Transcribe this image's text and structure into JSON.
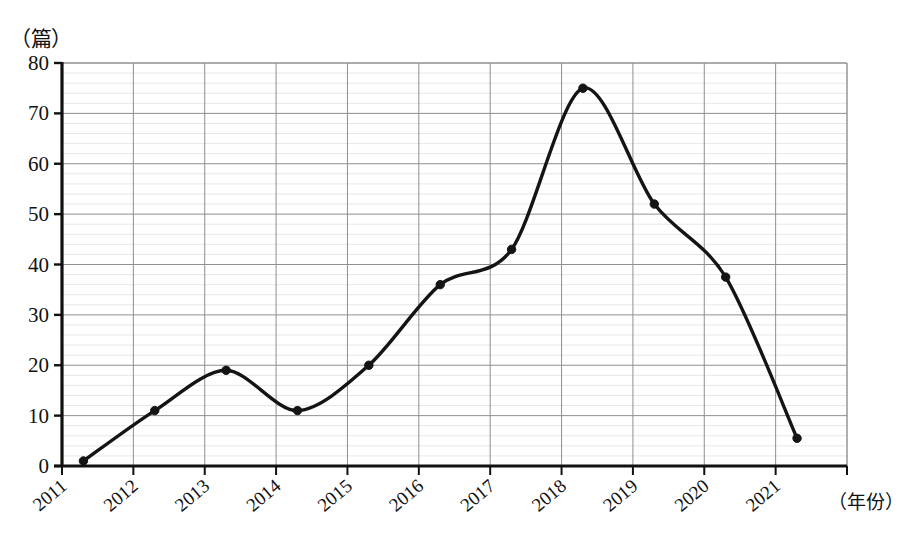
{
  "chart_data": {
    "type": "line",
    "title": "",
    "subtitle": "",
    "xlabel": "（年份）",
    "ylabel": "（篇）",
    "categories": [
      "2011",
      "2012",
      "2013",
      "2014",
      "2015",
      "2016",
      "2017",
      "2018",
      "2019",
      "2020",
      "2021"
    ],
    "values": [
      1,
      11,
      19,
      11,
      20,
      36,
      43,
      75,
      52,
      37.5,
      5.5
    ],
    "series": [
      {
        "name": "",
        "values": [
          1,
          11,
          19,
          11,
          20,
          36,
          43,
          75,
          52,
          37.5,
          5.5
        ]
      }
    ],
    "ylim": [
      0,
      80
    ],
    "ytick_labels": [
      "0",
      "10",
      "20",
      "30",
      "40",
      "50",
      "60",
      "70",
      "80"
    ],
    "ytick_values": [
      0,
      10,
      20,
      30,
      40,
      50,
      60,
      70,
      80
    ],
    "grid": true,
    "minor_grid": true,
    "minor_grid_step": 2,
    "legend": "none",
    "line_color": "#141414",
    "marker_color": "#141414",
    "grid_color": "#8f8f8f",
    "minor_grid_color": "#dcdcdc",
    "axis_color": "#111111",
    "background": "#ffffff",
    "smoothing": "spline",
    "marker_shape": "circle",
    "xtick_rotation": -40
  },
  "axes": {
    "y_unit_label": "（篇）",
    "x_title": "（年份）"
  }
}
